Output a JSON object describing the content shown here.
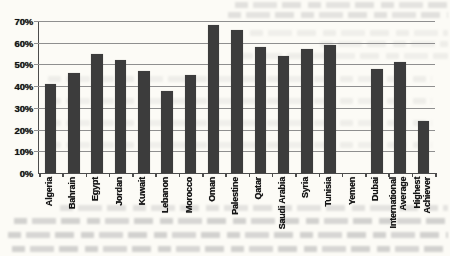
{
  "figure": {
    "bar_color": "#3c3c3c",
    "gridline_color": "#8f8f8f",
    "axis_color": "#4c4c4c",
    "paper_color": "#fcfbf6",
    "text_color": "#151515"
  },
  "chart_data": {
    "type": "bar",
    "title": "",
    "xlabel": "",
    "ylabel": "",
    "categories": [
      "Algeria",
      "Bahrain",
      "Egypt",
      "Jordan",
      "Kuwait",
      "Lebanon",
      "Morocco",
      "Oman",
      "Palestine",
      "Qatar",
      "Saudi Arabia",
      "Syria",
      "Tunisia",
      "Yemen",
      "Dubai",
      "International\nAverage",
      "Highest\nAchiever"
    ],
    "values": [
      41,
      46,
      55,
      52,
      47,
      38,
      45,
      68,
      66,
      58,
      54,
      57,
      59,
      0,
      48,
      51,
      24
    ],
    "unit": "%",
    "ylim": [
      0,
      70
    ],
    "ytick_step": 10,
    "yticks": [
      "0%",
      "10%",
      "20%",
      "30%",
      "40%",
      "50%",
      "60%",
      "70%"
    ],
    "grid": true,
    "legend": "none"
  }
}
